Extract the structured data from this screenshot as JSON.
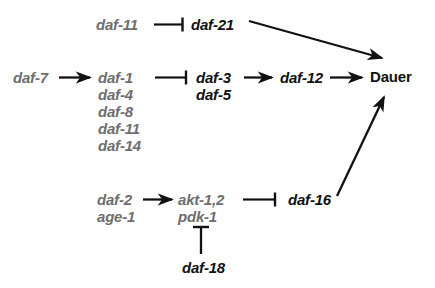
{
  "diagram": {
    "colors": {
      "gray_gene": "#6e6e6e",
      "black_gene": "#111111",
      "edge": "#111111",
      "background": "#ffffff"
    },
    "nodes": {
      "daf11_top": {
        "label": "daf-11",
        "style": "gray",
        "x": 96,
        "y": 16
      },
      "daf21": {
        "label": "daf-21",
        "style": "black",
        "x": 191,
        "y": 16
      },
      "daf7": {
        "label": "daf-7",
        "style": "gray",
        "x": 13,
        "y": 69
      },
      "daf1_cluster": {
        "style": "gray",
        "x": 98,
        "y": 69,
        "items": [
          "daf-1",
          "daf-4",
          "daf-8",
          "daf-11",
          "daf-14"
        ]
      },
      "daf3_cluster": {
        "style": "black",
        "x": 196,
        "y": 69,
        "items": [
          "daf-3",
          "daf-5"
        ]
      },
      "daf12": {
        "label": "daf-12",
        "style": "black",
        "x": 280,
        "y": 69
      },
      "dauer": {
        "label": "Dauer",
        "style": "black-upright",
        "x": 370,
        "y": 68
      },
      "daf2_cluster": {
        "style": "gray",
        "x": 97,
        "y": 191,
        "items": [
          "daf-2",
          "age-1"
        ]
      },
      "akt_cluster": {
        "style": "gray",
        "x": 178,
        "y": 191,
        "items": [
          "akt-1,2",
          "pdk-1"
        ]
      },
      "daf16": {
        "label": "daf-16",
        "style": "black",
        "x": 288,
        "y": 191
      },
      "daf18": {
        "label": "daf-18",
        "style": "black",
        "x": 182,
        "y": 259
      }
    },
    "edges": [
      {
        "id": "daf11-inhibits-daf21",
        "type": "inhibition",
        "from": "daf-11",
        "to": "daf-21"
      },
      {
        "id": "daf21-activates-dauer",
        "type": "activation",
        "from": "daf-21",
        "to": "Dauer"
      },
      {
        "id": "daf7-activates-daf1",
        "type": "activation",
        "from": "daf-7",
        "to": "daf-1"
      },
      {
        "id": "daf1-inhibits-daf3",
        "type": "inhibition",
        "from": "daf-1",
        "to": "daf-3"
      },
      {
        "id": "daf3-activates-daf12",
        "type": "activation",
        "from": "daf-3",
        "to": "daf-12"
      },
      {
        "id": "daf12-activates-dauer",
        "type": "activation",
        "from": "daf-12",
        "to": "Dauer"
      },
      {
        "id": "daf2-activates-akt",
        "type": "activation",
        "from": "daf-2",
        "to": "akt-1,2"
      },
      {
        "id": "akt-inhibits-daf16",
        "type": "inhibition",
        "from": "akt-1,2",
        "to": "daf-16"
      },
      {
        "id": "daf18-inhibits-pdk1",
        "type": "inhibition",
        "from": "daf-18",
        "to": "pdk-1"
      },
      {
        "id": "daf16-activates-dauer",
        "type": "activation",
        "from": "daf-16",
        "to": "Dauer"
      }
    ]
  }
}
